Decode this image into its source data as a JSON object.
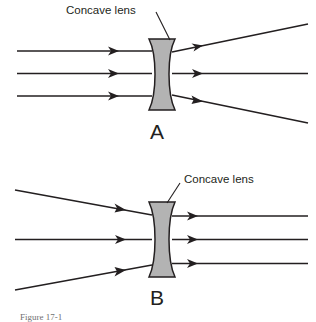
{
  "figure": {
    "caption": "Figure 17-1",
    "panels": [
      {
        "id": "A",
        "letter": "A",
        "lens_label": "Concave lens",
        "description": "Parallel rays diverge after passing through a concave lens",
        "incoming_rays": "parallel",
        "outgoing_rays": "diverging",
        "ray_count": 3
      },
      {
        "id": "B",
        "letter": "B",
        "lens_label": "Concave lens",
        "description": "Converging rays emerge parallel after passing through a concave lens",
        "incoming_rays": "converging",
        "outgoing_rays": "parallel",
        "ray_count": 3
      }
    ]
  },
  "colors": {
    "line": "#231f20",
    "lens_fill": "#b3b3b3",
    "background": "#ffffff",
    "caption": "#6f6f6f"
  }
}
